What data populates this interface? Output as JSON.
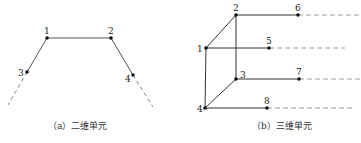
{
  "figure_a": {
    "caption": "（a）二维单元",
    "nodes": [
      {
        "id": "1",
        "x": 47,
        "y": 38
      },
      {
        "id": "2",
        "x": 111,
        "y": 38
      },
      {
        "id": "3",
        "x": 27,
        "y": 72
      },
      {
        "id": "4",
        "x": 133,
        "y": 75
      }
    ]
  },
  "figure_b": {
    "caption": "（b）三维单元",
    "nodes": [
      {
        "id": "1",
        "x": 206,
        "y": 48
      },
      {
        "id": "2",
        "x": 236,
        "y": 15
      },
      {
        "id": "3",
        "x": 236,
        "y": 79
      },
      {
        "id": "4",
        "x": 205,
        "y": 108
      },
      {
        "id": "5",
        "x": 269,
        "y": 48
      },
      {
        "id": "6",
        "x": 298,
        "y": 15
      },
      {
        "id": "7",
        "x": 299,
        "y": 79
      },
      {
        "id": "8",
        "x": 267,
        "y": 108
      }
    ]
  },
  "colors": {
    "line": "#333333",
    "dash": "#999999",
    "node": "#111111"
  }
}
